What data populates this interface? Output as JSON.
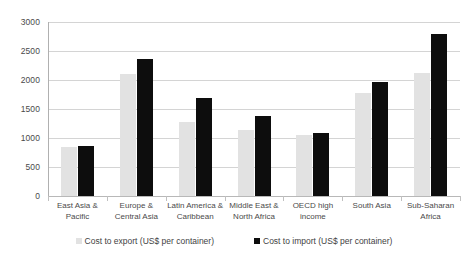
{
  "chart_data": {
    "type": "bar",
    "title": "",
    "xlabel": "",
    "ylabel": "",
    "ylim": [
      0,
      3000
    ],
    "ytick_step": 500,
    "yticks": [
      "0",
      "500",
      "1000",
      "1500",
      "2000",
      "2500",
      "3000"
    ],
    "grid": true,
    "legend_position": "bottom",
    "categories": [
      "East Asia & Pacific",
      "Europe & Central Asia",
      "Latin America & Caribbean",
      "Middle East & North Africa",
      "OECD high income",
      "South Asia",
      "Sub-Saharan Africa"
    ],
    "series": [
      {
        "name": "Cost to export (US$ per container)",
        "color": "#e2e2e2",
        "values": [
          840,
          2100,
          1280,
          1140,
          1050,
          1780,
          2120
        ]
      },
      {
        "name": "Cost to import (US$ per container)",
        "color": "#0d0d0d",
        "values": [
          870,
          2360,
          1690,
          1380,
          1090,
          1970,
          2790
        ]
      }
    ]
  },
  "legend": {
    "items": [
      {
        "label": "Cost to export (US$ per container)",
        "swatch": "export"
      },
      {
        "label": "Cost to import (US$ per container)",
        "swatch": "import"
      }
    ]
  }
}
